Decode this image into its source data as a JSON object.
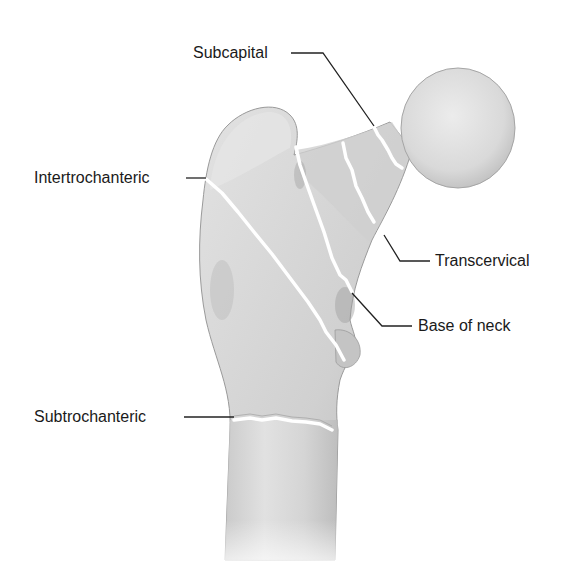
{
  "figure": {
    "labels": {
      "subcapital": "Subcapital",
      "intertrochanteric": "Intertrochanteric",
      "transcervical": "Transcervical",
      "base_of_neck": "Base of neck",
      "subtrochanteric": "Subtrochanteric"
    },
    "colors": {
      "bone_light": "#e6e6e6",
      "bone_mid": "#cfcfcf",
      "bone_dark": "#a9a9a9",
      "fracture_line": "#ffffff",
      "leader_line": "#222222",
      "text": "#1a1a1a"
    }
  }
}
